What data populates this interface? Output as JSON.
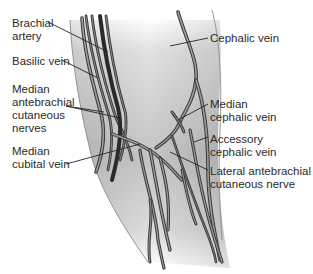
{
  "diagram": {
    "colors": {
      "skin_dark": "#b9b9b9",
      "skin_light": "#f4f4f4",
      "outline": "#8a8a8a",
      "vessel_stroke": "#3a3a3a",
      "vessel_fill": "#9a9a9a",
      "artery": "#2a2a2a",
      "leader": "#222222",
      "text": "#2b2b2b"
    },
    "labels": [
      {
        "id": "brachial-artery",
        "text": "Brachial\nartery"
      },
      {
        "id": "basilic-vein",
        "text": "Basilic vein"
      },
      {
        "id": "median-antebrachial-cutaneous-nerves",
        "text": "Median\nantebrachial\ncutaneous\nnerves"
      },
      {
        "id": "median-cubital-vein",
        "text": "Median\ncubital vein"
      },
      {
        "id": "cephalic-vein",
        "text": "Cephalic vein"
      },
      {
        "id": "median-cephalic-vein",
        "text": "Median\ncephalic vein"
      },
      {
        "id": "accessory-cephalic-vein",
        "text": "Accessory\ncephalic vein"
      },
      {
        "id": "lateral-antebrachial-cutaneous-nerve",
        "text": "Lateral antebrachial\ncutaneous nerve"
      }
    ]
  }
}
